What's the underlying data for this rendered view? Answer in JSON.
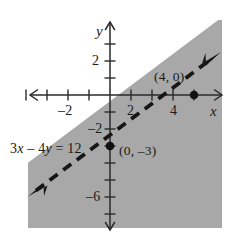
{
  "figure": {
    "kind": "coordinate-plane-inequality-graph",
    "width": 240,
    "height": 238,
    "background_color": "#ffffff",
    "ink_color": "#1a1a1a",
    "shade_color": "#a8a8a8"
  },
  "axes": {
    "x_axis_label": "x",
    "y_axis_label": "y",
    "origin_px": {
      "x": 110,
      "y": 95
    },
    "unit_px": {
      "x": 21,
      "y": 17
    },
    "x_range": [
      -4.2,
      5.6
    ],
    "y_range": [
      -7.8,
      3.6
    ],
    "x_tick_labels": [
      {
        "value": -2,
        "text": "–2"
      },
      {
        "value": 2,
        "text": "2"
      },
      {
        "value": 4,
        "text": "4"
      }
    ],
    "y_tick_labels": [
      {
        "value": 2,
        "text": "2"
      },
      {
        "value": -2,
        "text": "–2"
      },
      {
        "value": -6,
        "text": "–6"
      }
    ],
    "x_ticks": [
      -4,
      -3,
      -2,
      -1,
      1,
      2,
      3,
      4,
      5
    ],
    "y_ticks": [
      3,
      2,
      1,
      -1,
      -2,
      -3,
      -4,
      -5,
      -6,
      -7
    ]
  },
  "boundary_line": {
    "equation_label_parts": {
      "coef_x": "3",
      "var_x": "x",
      "minus": " – ",
      "coef_y": "4",
      "var_y": "y",
      "equals": " = ",
      "constant": "12"
    },
    "equation_label_text": "3x – 4y = 12",
    "style": "dashed",
    "slope": 0.75,
    "y_intercept": -3,
    "x_intercept": 4,
    "arrowheads": [
      "lower-left",
      "upper-right"
    ],
    "dash_pattern": "10 7",
    "stroke_width": 3.6
  },
  "points": [
    {
      "label": "(4, 0)",
      "x": 4,
      "y": 0,
      "marker": "filled-dot"
    },
    {
      "label": "(0, –3)",
      "x": 0,
      "y": -3,
      "marker": "filled-dot"
    }
  ],
  "shading": {
    "region": "below-right-of-line",
    "inequality": "3x – 4y > 12",
    "fill": "#a8a8a8",
    "bounds_px": {
      "left": 28,
      "right": 222,
      "top": 20,
      "bottom": 228
    }
  }
}
